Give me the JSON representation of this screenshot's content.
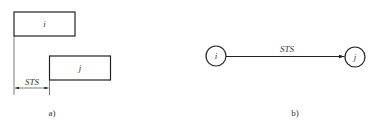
{
  "panel_a": {
    "caption": "a)",
    "activity_i": "i",
    "activity_j": "j",
    "relation_label": "STS"
  },
  "panel_b": {
    "caption": "b)",
    "node_i": "i",
    "node_j": "j",
    "edge_label": "STS"
  }
}
